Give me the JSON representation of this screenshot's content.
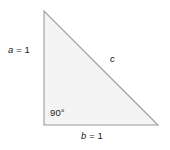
{
  "figure": {
    "name": "right-triangle-diagram",
    "background_color": "#ffffff",
    "stroke_color": "#9a9a9a",
    "fill_color": "#f4f4f4",
    "text_color": "#1a1a1a"
  },
  "labels": {
    "side_a": {
      "var": "a",
      "eq": " = 1"
    },
    "side_b": {
      "var": "b",
      "eq": " = 1"
    },
    "side_c": {
      "var": "c"
    },
    "angle": "90°"
  },
  "geometry": {
    "apex": {
      "x": 44,
      "y": 11
    },
    "bottom_left": {
      "x": 44,
      "y": 125
    },
    "bottom_right": {
      "x": 158,
      "y": 125
    },
    "points": "44,11 44,125 158,125"
  }
}
